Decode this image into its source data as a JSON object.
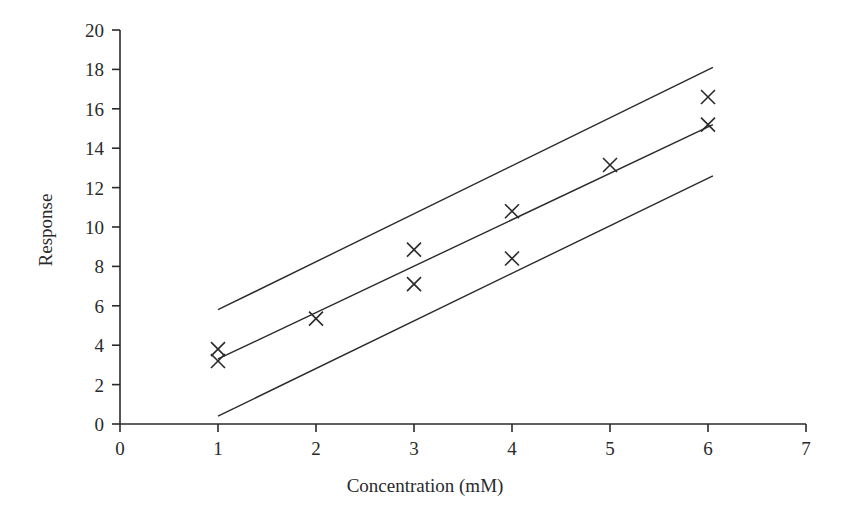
{
  "chart_data": {
    "type": "scatter",
    "title": "",
    "xlabel": "Concentration (mM)",
    "ylabel": "Response",
    "xlim": [
      0,
      7
    ],
    "ylim": [
      0,
      20
    ],
    "xticks": [
      0,
      1,
      2,
      3,
      4,
      5,
      6,
      7
    ],
    "yticks": [
      0,
      2,
      4,
      6,
      8,
      10,
      12,
      14,
      16,
      18,
      20
    ],
    "xtick_labels": [
      "0",
      "1",
      "2",
      "3",
      "4",
      "5",
      "6",
      "7"
    ],
    "ytick_labels": [
      "0",
      "2",
      "4",
      "6",
      "8",
      "10",
      "12",
      "14",
      "16",
      "18",
      "20"
    ],
    "grid": false,
    "legend": null,
    "marker": "x",
    "marker_color": "#2a2a2a",
    "line_color": "#2a2a2a",
    "points": [
      {
        "x": 1,
        "y": 3.8
      },
      {
        "x": 1,
        "y": 3.2
      },
      {
        "x": 2,
        "y": 5.35
      },
      {
        "x": 3,
        "y": 8.85
      },
      {
        "x": 3,
        "y": 7.1
      },
      {
        "x": 4,
        "y": 10.8
      },
      {
        "x": 4,
        "y": 8.4
      },
      {
        "x": 5,
        "y": 13.15
      },
      {
        "x": 6,
        "y": 16.6
      },
      {
        "x": 6,
        "y": 15.2
      }
    ],
    "series": [
      {
        "name": "upper-confidence-line",
        "type": "line",
        "x": [
          1,
          6.05
        ],
        "values": [
          5.8,
          18.1
        ]
      },
      {
        "name": "regression-line",
        "type": "line",
        "x": [
          1,
          6.05
        ],
        "values": [
          3.3,
          15.2
        ]
      },
      {
        "name": "lower-confidence-line",
        "type": "line",
        "x": [
          1,
          6.05
        ],
        "values": [
          0.4,
          12.6
        ]
      }
    ]
  }
}
